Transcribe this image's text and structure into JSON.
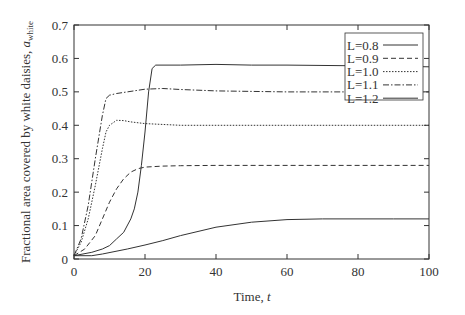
{
  "chart_data": {
    "type": "line",
    "title": "",
    "xlabel": "Time, t",
    "ylabel": "Fractional area covered by white daisies, a_white",
    "xlim": [
      0,
      100
    ],
    "ylim": [
      0,
      0.7
    ],
    "xticks": [
      0,
      20,
      40,
      60,
      80,
      100
    ],
    "yticks": [
      0,
      0.1,
      0.2,
      0.3,
      0.4,
      0.5,
      0.6,
      0.7
    ],
    "grid": false,
    "legend_position": "upper right",
    "series": [
      {
        "name": "L=0.8",
        "style": "solid",
        "x": [
          0,
          5,
          8,
          15,
          20,
          25,
          30,
          40,
          50,
          60,
          70,
          80,
          90,
          100
        ],
        "y": [
          0.01,
          0.01,
          0.015,
          0.03,
          0.042,
          0.055,
          0.07,
          0.095,
          0.11,
          0.118,
          0.12,
          0.12,
          0.12,
          0.12
        ]
      },
      {
        "name": "L=0.9",
        "style": "dashed",
        "x": [
          0,
          3,
          6,
          8,
          10,
          12,
          14,
          16,
          18,
          20,
          25,
          30,
          40,
          60,
          80,
          100
        ],
        "y": [
          0.01,
          0.03,
          0.07,
          0.12,
          0.17,
          0.21,
          0.24,
          0.26,
          0.27,
          0.275,
          0.278,
          0.279,
          0.28,
          0.28,
          0.28,
          0.28
        ]
      },
      {
        "name": "L=1.0",
        "style": "dotted",
        "x": [
          0,
          2,
          4,
          6,
          8,
          9,
          10,
          12,
          14,
          16,
          20,
          30,
          40,
          60,
          80,
          100
        ],
        "y": [
          0.01,
          0.05,
          0.12,
          0.22,
          0.33,
          0.38,
          0.4,
          0.415,
          0.414,
          0.41,
          0.405,
          0.4,
          0.4,
          0.4,
          0.4,
          0.4
        ]
      },
      {
        "name": "L=1.1",
        "style": "dashdot",
        "x": [
          0,
          2,
          4,
          6,
          8,
          9,
          10,
          12,
          15,
          20,
          25,
          30,
          40,
          60,
          80,
          100
        ],
        "y": [
          0.01,
          0.06,
          0.16,
          0.3,
          0.43,
          0.48,
          0.49,
          0.495,
          0.5,
          0.508,
          0.51,
          0.507,
          0.503,
          0.5,
          0.5,
          0.5
        ]
      },
      {
        "name": "L=1.2",
        "style": "solid",
        "x": [
          0,
          5,
          8,
          10,
          12,
          14,
          16,
          17,
          18,
          19,
          20,
          21,
          22,
          23,
          30,
          40,
          50,
          60,
          80,
          100
        ],
        "y": [
          0.01,
          0.02,
          0.03,
          0.04,
          0.06,
          0.08,
          0.12,
          0.15,
          0.2,
          0.28,
          0.38,
          0.5,
          0.57,
          0.58,
          0.58,
          0.582,
          0.58,
          0.58,
          0.578,
          0.575
        ]
      }
    ]
  },
  "axes": {
    "xlabel_text": "Time, ",
    "xlabel_var": "t",
    "ylabel_text": "Fractional area covered by white daisies, ",
    "ylabel_var": "a",
    "ylabel_sub": "white"
  },
  "legend": {
    "items": [
      "L=0.8",
      "L=0.9",
      "L=1.0",
      "L=1.1",
      "L=1.2"
    ]
  }
}
